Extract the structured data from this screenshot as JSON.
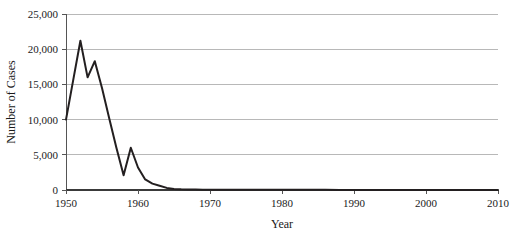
{
  "chart_data": {
    "type": "line",
    "title": "",
    "subtitle": "",
    "xlabel": "Year",
    "ylabel": "Number of Cases",
    "xlim": [
      1950,
      2010
    ],
    "ylim": [
      0,
      25000
    ],
    "grid": true,
    "legend": false,
    "legend_position": "none",
    "x_ticks": [
      1950,
      1960,
      1970,
      1980,
      1990,
      2000,
      2010
    ],
    "x_tick_labels": [
      "1950",
      "1960",
      "1970",
      "1980",
      "1990",
      "2000",
      "2010"
    ],
    "y_ticks": [
      0,
      5000,
      10000,
      15000,
      20000,
      25000
    ],
    "y_tick_labels": [
      "0",
      "5,000",
      "10,000",
      "15,000",
      "20,000",
      "25,000"
    ],
    "series": [
      {
        "name": "Cases",
        "color": "#231f20",
        "x": [
          1950,
          1951,
          1952,
          1953,
          1954,
          1955,
          1956,
          1957,
          1958,
          1959,
          1960,
          1961,
          1962,
          1963,
          1964,
          1965,
          1966,
          1967,
          1968,
          1969,
          1970,
          1972,
          1974,
          1976,
          1978,
          1980,
          1982,
          1984,
          1986,
          1988,
          1990,
          1992,
          1994,
          1996,
          1998,
          2000,
          2002,
          2004,
          2006,
          2008,
          2010
        ],
        "values": [
          10000,
          15600,
          21200,
          16000,
          18300,
          14500,
          10200,
          6000,
          2100,
          6000,
          3200,
          1500,
          900,
          600,
          300,
          150,
          100,
          80,
          60,
          50,
          40,
          35,
          30,
          30,
          25,
          25,
          20,
          20,
          20,
          15,
          15,
          15,
          10,
          10,
          10,
          10,
          10,
          10,
          10,
          10,
          10
        ]
      }
    ],
    "annotations": []
  },
  "axes": {
    "y_axis_title": "Number of Cases",
    "x_axis_title": "Year"
  },
  "colors": {
    "line": "#231f20",
    "gridline": "#9a9a9a",
    "axis": "#555555",
    "background": "#ffffff",
    "text": "#1a1a1a"
  }
}
